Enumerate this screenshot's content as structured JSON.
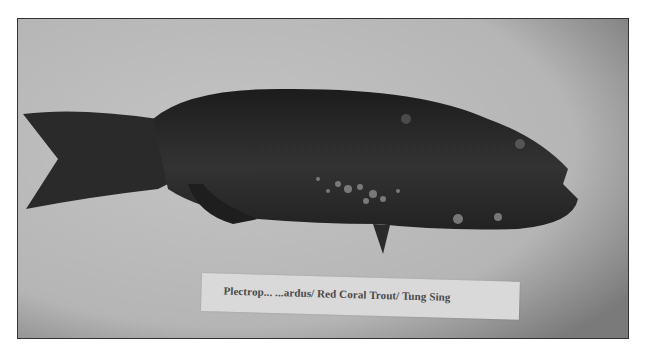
{
  "image": {
    "description": "Grayscale photograph of a dark fish specimen lying on a light surface with a paper identification label below it",
    "subject": "fish",
    "label": {
      "text": "Plectropomus leopardus/ Red Coral Trout/ Tung Sing",
      "visible_text": "Plectrop... ...ardus/ Red Coral Trout/ Tung Sing"
    },
    "colors": {
      "background": "#bdbdbd",
      "fish": "#262626",
      "label_paper": "#d9d9d9",
      "border": "#333333"
    }
  }
}
